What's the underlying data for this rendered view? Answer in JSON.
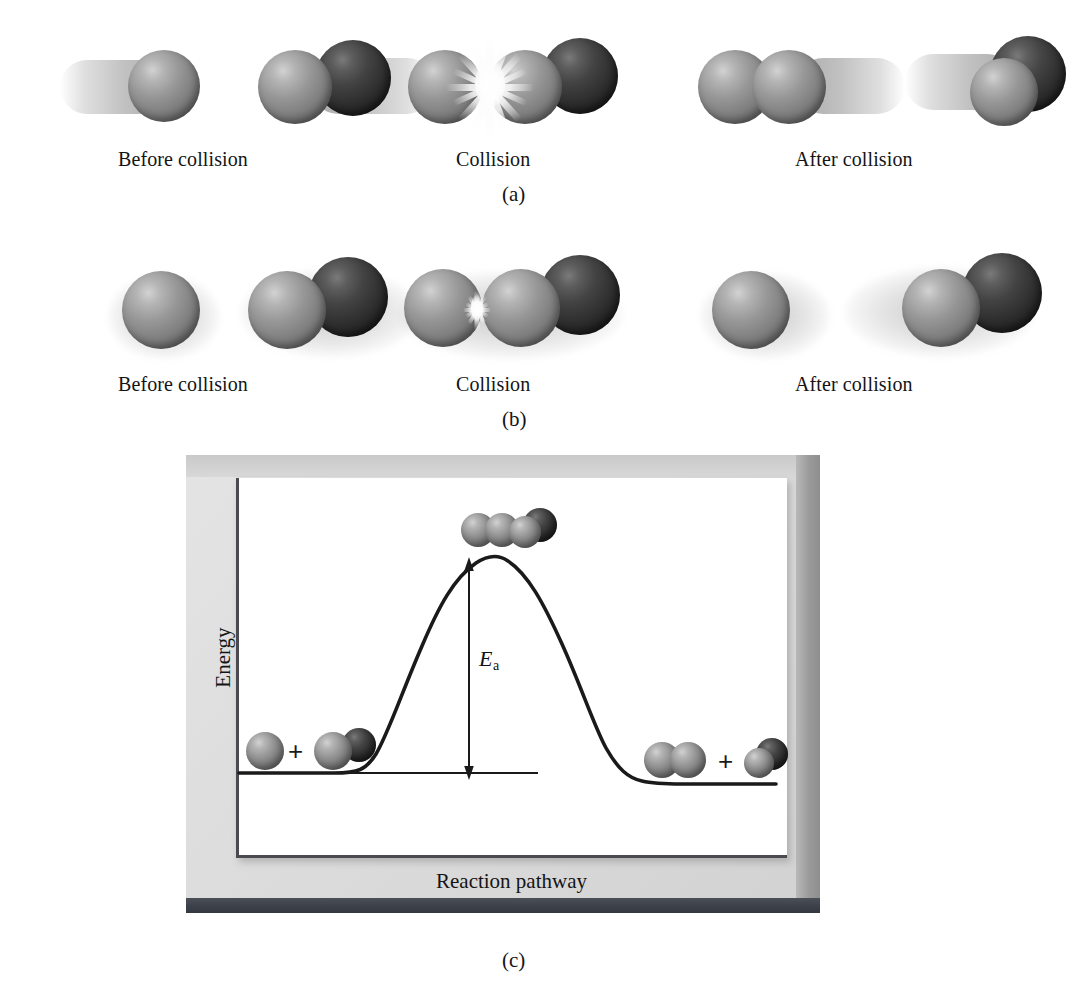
{
  "figure": {
    "colors": {
      "sphere_gray": "#8a8a8a",
      "sphere_dark": "#2e2e2e",
      "panel_background": "#dcdcdc",
      "plot_background": "#ffffff",
      "curve": "#1a1a1a",
      "axis": "#4a4a50",
      "bottom_bar": "#3c4049",
      "text": "#141414"
    }
  },
  "panels": [
    {
      "id": "a",
      "label": "(a)",
      "description": "Effective collision: reaction occurs",
      "stages": [
        {
          "name": "before",
          "label": "Before collision"
        },
        {
          "name": "collision",
          "label": "Collision"
        },
        {
          "name": "after",
          "label": "After collision"
        }
      ]
    },
    {
      "id": "b",
      "label": "(b)",
      "description": "Ineffective collision: no reaction",
      "stages": [
        {
          "name": "before",
          "label": "Before collision"
        },
        {
          "name": "collision",
          "label": "Collision"
        },
        {
          "name": "after",
          "label": "After collision"
        }
      ]
    },
    {
      "id": "c",
      "label": "(c)",
      "description": "Potential energy profile of the reaction"
    }
  ],
  "chart_data": {
    "type": "line",
    "title": "",
    "xlabel": "Reaction pathway",
    "ylabel": "Energy",
    "grid": false,
    "legend": null,
    "axis_ticks": {
      "x": [],
      "y": []
    },
    "annotations": [
      {
        "name": "activation-energy",
        "text": "E_a",
        "display": "Ea",
        "symbol": "E",
        "subscript": "a",
        "type": "double-headed-vertical-arrow",
        "from_level": "reactants",
        "to_level": "transition-state"
      },
      {
        "name": "reactant-level-line",
        "type": "horizontal-reference-line",
        "level": "reactants"
      },
      {
        "name": "reactants-molecules",
        "type": "molecule-group",
        "text": "+"
      },
      {
        "name": "transition-state-molecules",
        "type": "molecule-group",
        "text": ""
      },
      {
        "name": "products-molecules",
        "type": "molecule-group",
        "text": "+"
      }
    ],
    "levels": {
      "reactants": 0.34,
      "transition_state": 1.0,
      "products": 0.12
    },
    "x": [
      0.0,
      0.1,
      0.18,
      0.26,
      0.34,
      0.42,
      0.5,
      0.58,
      0.66,
      0.72,
      0.8,
      0.9,
      1.0
    ],
    "y": [
      0.34,
      0.34,
      0.35,
      0.45,
      0.68,
      0.9,
      1.0,
      0.92,
      0.7,
      0.45,
      0.16,
      0.12,
      0.12
    ],
    "ylim": [
      0.0,
      1.12
    ],
    "xlim": [
      0.0,
      1.0
    ]
  }
}
